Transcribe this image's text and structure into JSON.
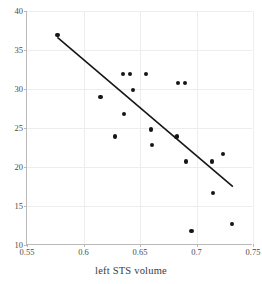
{
  "chart_data": {
    "type": "scatter",
    "title": "",
    "xlabel": "left STS volume",
    "ylabel": "",
    "xlim": [
      0.55,
      0.75
    ],
    "ylim": [
      10,
      40
    ],
    "xticks": [
      "0.55",
      "0.6",
      "0.65",
      "0.7",
      "0.75"
    ],
    "xtick_values": [
      0.55,
      0.6,
      0.65,
      0.7,
      0.75
    ],
    "yticks": [
      "10",
      "15",
      "20",
      "25",
      "30",
      "35",
      "40"
    ],
    "ytick_values": [
      10,
      15,
      20,
      25,
      30,
      35,
      40
    ],
    "grid": true,
    "legend": null,
    "marker": "filled-circle",
    "marker_color": "#161616",
    "points": [
      {
        "x": 0.577,
        "y": 36.9
      },
      {
        "x": 0.615,
        "y": 29.0
      },
      {
        "x": 0.628,
        "y": 23.9
      },
      {
        "x": 0.635,
        "y": 31.9
      },
      {
        "x": 0.6355,
        "y": 26.8
      },
      {
        "x": 0.6415,
        "y": 31.9
      },
      {
        "x": 0.6435,
        "y": 29.9
      },
      {
        "x": 0.6555,
        "y": 31.9
      },
      {
        "x": 0.6595,
        "y": 24.8
      },
      {
        "x": 0.6605,
        "y": 22.8
      },
      {
        "x": 0.6815,
        "y": 23.8
      },
      {
        "x": 0.6825,
        "y": 23.9
      },
      {
        "x": 0.6835,
        "y": 30.8
      },
      {
        "x": 0.6895,
        "y": 30.8
      },
      {
        "x": 0.6905,
        "y": 20.7
      },
      {
        "x": 0.6955,
        "y": 11.8
      },
      {
        "x": 0.7135,
        "y": 20.7
      },
      {
        "x": 0.7145,
        "y": 16.7
      },
      {
        "x": 0.7235,
        "y": 21.7
      },
      {
        "x": 0.7315,
        "y": 12.7
      }
    ],
    "trendline": {
      "type": "linear-fit",
      "color": "#161616",
      "x_start": 0.577,
      "y_start": 36.6,
      "x_end": 0.733,
      "y_end": 17.4
    }
  }
}
